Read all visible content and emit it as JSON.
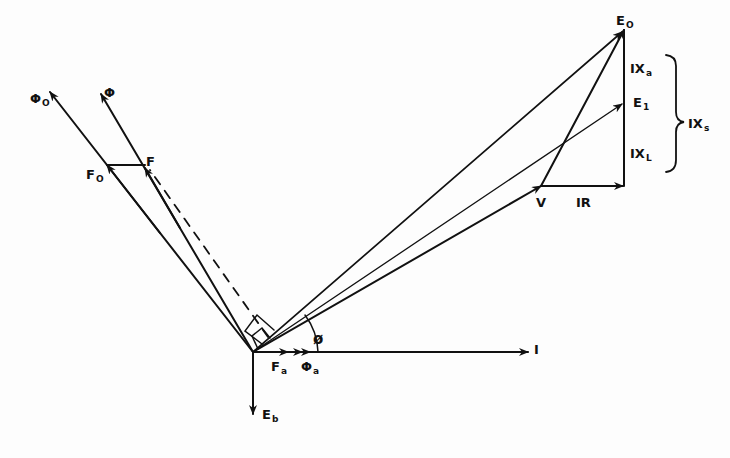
{
  "diagram": {
    "type": "phasor-diagram",
    "origin": [
      253,
      352
    ],
    "stroke_color": "#111111",
    "background": "#fdfdfd",
    "labels": {
      "phi_o": {
        "main": "Φ",
        "sub": "O"
      },
      "phi": {
        "main": "Φ",
        "sub": ""
      },
      "f_o": {
        "main": "F",
        "sub": "O"
      },
      "f": {
        "main": "F",
        "sub": ""
      },
      "e_o": {
        "main": "E",
        "sub": "O"
      },
      "e_1": {
        "main": "E",
        "sub": "1"
      },
      "ix_a": {
        "main": "IX",
        "sub": "a"
      },
      "ix_l": {
        "main": "IX",
        "sub": "L"
      },
      "ix_s": {
        "main": "IX",
        "sub": "s"
      },
      "v": {
        "main": "V",
        "sub": ""
      },
      "ir": {
        "main": "IR",
        "sub": ""
      },
      "i": {
        "main": "I",
        "sub": ""
      },
      "phase_angle": {
        "main": "ø",
        "sub": ""
      },
      "f_a": {
        "main": "F",
        "sub": "a"
      },
      "phi_a": {
        "main": "Φ",
        "sub": "a"
      },
      "e_b": {
        "main": "E",
        "sub": "b"
      }
    },
    "vectors": [
      {
        "name": "I",
        "from": [
          253,
          352
        ],
        "to": [
          528,
          352
        ],
        "style": "solid"
      },
      {
        "name": "V",
        "from": [
          253,
          352
        ],
        "to": [
          541,
          186
        ],
        "style": "solid"
      },
      {
        "name": "E1",
        "from": [
          253,
          352
        ],
        "to": [
          624,
          102
        ],
        "style": "solid-thin"
      },
      {
        "name": "E0",
        "from": [
          253,
          352
        ],
        "to": [
          624,
          30
        ],
        "style": "solid"
      },
      {
        "name": "IR",
        "from": [
          541,
          186
        ],
        "to": [
          624,
          186
        ],
        "style": "solid"
      },
      {
        "name": "IXs",
        "from": [
          624,
          186
        ],
        "to": [
          624,
          30
        ],
        "style": "solid"
      },
      {
        "name": "V-to-E0",
        "from": [
          541,
          186
        ],
        "to": [
          624,
          30
        ],
        "style": "solid"
      },
      {
        "name": "Phi0",
        "from": [
          253,
          352
        ],
        "to": [
          50,
          92
        ],
        "style": "solid"
      },
      {
        "name": "Phi",
        "from": [
          253,
          352
        ],
        "to": [
          101,
          94
        ],
        "style": "solid"
      },
      {
        "name": "F-to-F-dashed",
        "from": [
          260,
          340
        ],
        "to": [
          145,
          165
        ],
        "style": "dashed"
      },
      {
        "name": "F0-to-F",
        "from": [
          107,
          165
        ],
        "to": [
          145,
          165
        ],
        "style": "solid"
      },
      {
        "name": "Fa",
        "from": [
          253,
          352
        ],
        "to": [
          288,
          352
        ],
        "style": "arrow-only"
      },
      {
        "name": "Phia",
        "from": [
          288,
          352
        ],
        "to": [
          312,
          352
        ],
        "style": "arrow-only"
      },
      {
        "name": "Eb",
        "from": [
          253,
          352
        ],
        "to": [
          253,
          414
        ],
        "style": "solid"
      }
    ],
    "brace": {
      "label": "IXs",
      "spans": [
        "IXa",
        "IXL"
      ]
    }
  }
}
